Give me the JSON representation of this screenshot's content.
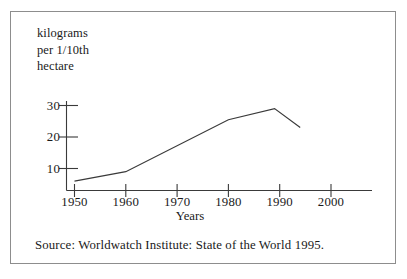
{
  "figure": {
    "border_color": "#8d8d8d",
    "background": "#ffffff",
    "ink_color": "#3a3a3a"
  },
  "chart_data": {
    "type": "line",
    "title": "",
    "subtitle": "",
    "xlabel": "Years",
    "ylabel": "kilograms per 1/10th hectare",
    "ylabel_lines": [
      "kilograms",
      "per 1/10th",
      "hectare"
    ],
    "x": [
      1950,
      1960,
      1980,
      1989,
      1994
    ],
    "values": [
      6,
      9,
      25.5,
      29,
      23
    ],
    "series": [
      {
        "name": "fertilizer use",
        "x": [
          1950,
          1960,
          1980,
          1989,
          1994
        ],
        "values": [
          6,
          9,
          25.5,
          29,
          23
        ]
      }
    ],
    "xlim": [
      1950,
      2005.8
    ],
    "ylim": [
      0,
      34
    ],
    "xticks": [
      1950,
      1960,
      1970,
      1980,
      1990,
      2000
    ],
    "xtick_labels": [
      "1950",
      "1960",
      "1970",
      "1980",
      "1990",
      "2000"
    ],
    "yticks": [
      10,
      20,
      30
    ],
    "ytick_labels": [
      "10",
      "20",
      "30"
    ],
    "grid": false,
    "legend": "none",
    "line_color": "#3a3a3a"
  },
  "source": {
    "text": "Source:  Worldwatch Institute:  State of the World 1995."
  }
}
